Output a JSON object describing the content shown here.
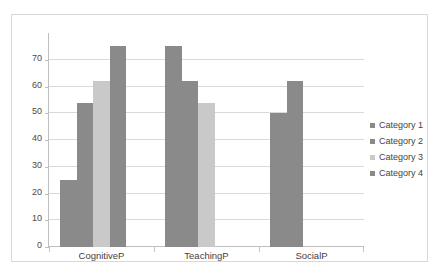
{
  "chart_data": {
    "type": "bar",
    "title": "",
    "subtitle": "",
    "xlabel": "",
    "ylabel": "",
    "categories": [
      "CognitiveP",
      "TeachingP",
      "SocialP"
    ],
    "series": [
      {
        "name": "Category 1",
        "color": "#8a8a8a",
        "values": [
          25,
          75,
          50
        ]
      },
      {
        "name": "Category 2",
        "color": "#8a8a8a",
        "values": [
          54,
          62,
          62
        ]
      },
      {
        "name": "Category 3",
        "color": "#c9c9c9",
        "values": [
          62,
          54,
          0
        ]
      },
      {
        "name": "Category 4",
        "color": "#8a8a8a",
        "values": [
          75,
          0,
          0
        ]
      }
    ],
    "ylim": [
      0,
      80
    ],
    "yticks": [
      0,
      10,
      20,
      30,
      40,
      50,
      60,
      70
    ],
    "ytick_labels": [
      "0",
      "10",
      "20",
      "30",
      "40",
      "50",
      "60",
      "70"
    ],
    "grid": true,
    "legend_position": "right"
  },
  "legend": {
    "items": [
      {
        "label": "Category 1",
        "color": "#8a8a8a"
      },
      {
        "label": "Category 2",
        "color": "#8a8a8a"
      },
      {
        "label": "Category 3",
        "color": "#c9c9c9"
      },
      {
        "label": "Category 4",
        "color": "#8a8a8a"
      }
    ]
  },
  "axes": {
    "y_labels": [
      "70",
      "60",
      "50",
      "40",
      "30",
      "20",
      "10",
      "0"
    ],
    "x_labels": [
      "CognitiveP",
      "TeachingP",
      "SocialP"
    ]
  },
  "colors": {
    "bar_dark": "#8a8a8a",
    "bar_light": "#c9c9c9",
    "gridline": "#d9d9d9",
    "axis": "#bfbfbf",
    "border": "#d8d8d8",
    "text": "#3f3f3f",
    "background": "#ffffff"
  }
}
